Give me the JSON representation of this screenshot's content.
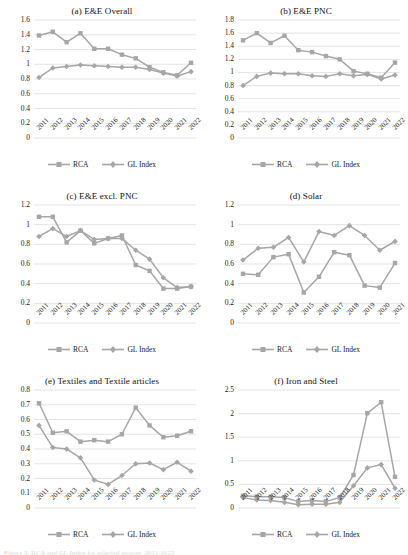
{
  "figure": {
    "caption": "Figure 3. RCA and GL Index for selected sectors, 2011-2022",
    "series_colors": {
      "rca": "#a6a6a6",
      "gl": "#a6a6a6",
      "grid": "#d9d9d9",
      "text": "#222222"
    },
    "legend": [
      {
        "name": "RCA",
        "label": "RCA",
        "marker": "square-marker"
      },
      {
        "name": "GL Index",
        "label": "GL Index",
        "marker": "diamond-marker"
      }
    ]
  },
  "chart_data": [
    {
      "type": "line",
      "panel": "a",
      "title": "(a) E&E Overall",
      "xlabel": "",
      "ylabel": "",
      "grid": true,
      "legend_position": "bottom",
      "ylim": [
        0,
        1.6
      ],
      "yticks": [
        0,
        0.2,
        0.4,
        0.6,
        0.8,
        1,
        1.2,
        1.4,
        1.6
      ],
      "ytick_labels": [
        "0",
        "0.2",
        "0.4",
        "0.6",
        "0.8",
        "1",
        "1.2",
        "1.4",
        "1.6"
      ],
      "categories": [
        "2011",
        "2012",
        "2013",
        "2014",
        "2015",
        "2016",
        "2017",
        "2018",
        "2019",
        "2020",
        "2021",
        "2022"
      ],
      "series": [
        {
          "name": "RCA",
          "values": [
            1.39,
            1.44,
            1.3,
            1.42,
            1.21,
            1.21,
            1.13,
            1.08,
            0.96,
            0.89,
            0.85,
            1.02
          ]
        },
        {
          "name": "GL Index",
          "values": [
            0.82,
            0.95,
            0.97,
            0.99,
            0.98,
            0.97,
            0.96,
            0.96,
            0.93,
            0.88,
            0.84,
            0.9
          ]
        }
      ]
    },
    {
      "type": "line",
      "panel": "b",
      "title": "(b) E&E PNC",
      "xlabel": "",
      "ylabel": "",
      "grid": true,
      "legend_position": "bottom",
      "ylim": [
        0,
        1.8
      ],
      "yticks": [
        0,
        0.2,
        0.4,
        0.6,
        0.8,
        1,
        1.2,
        1.4,
        1.6,
        1.8
      ],
      "ytick_labels": [
        "0",
        "0.2",
        "0.4",
        "0.6",
        "0.8",
        "1",
        "1.2",
        "1.4",
        "1.6",
        "1.8"
      ],
      "categories": [
        "2011",
        "2012",
        "2013",
        "2014",
        "2015",
        "2016",
        "2017",
        "2018",
        "2019",
        "2020",
        "2021",
        "2022"
      ],
      "series": [
        {
          "name": "RCA",
          "values": [
            1.49,
            1.6,
            1.45,
            1.56,
            1.34,
            1.31,
            1.25,
            1.2,
            1.02,
            0.98,
            0.92,
            1.15
          ]
        },
        {
          "name": "GL Index",
          "values": [
            0.8,
            0.94,
            0.99,
            0.98,
            0.98,
            0.95,
            0.94,
            0.98,
            0.95,
            0.97,
            0.9,
            0.96
          ]
        }
      ]
    },
    {
      "type": "line",
      "panel": "c",
      "title": "(c) E&E excl. PNC",
      "xlabel": "",
      "ylabel": "",
      "grid": true,
      "legend_position": "bottom",
      "ylim": [
        0,
        1.2
      ],
      "yticks": [
        0,
        0.2,
        0.4,
        0.6,
        0.8,
        1,
        1.2
      ],
      "ytick_labels": [
        "0",
        "0.2",
        "0.4",
        "0.6",
        "0.8",
        "1",
        "1.2"
      ],
      "categories": [
        "2011",
        "2012",
        "2013",
        "2014",
        "2015",
        "2016",
        "2017",
        "2018",
        "2019",
        "2020",
        "2021",
        "2022"
      ],
      "series": [
        {
          "name": "RCA",
          "values": [
            1.08,
            1.08,
            0.82,
            0.94,
            0.81,
            0.86,
            0.89,
            0.59,
            0.53,
            0.35,
            0.35,
            0.37
          ]
        },
        {
          "name": "GL Index",
          "values": [
            0.88,
            0.96,
            0.88,
            0.94,
            0.85,
            0.86,
            0.86,
            0.74,
            0.65,
            0.46,
            0.36,
            0.37
          ]
        }
      ]
    },
    {
      "type": "line",
      "panel": "d",
      "title": "(d) Solar",
      "xlabel": "",
      "ylabel": "",
      "grid": true,
      "legend_position": "bottom",
      "ylim": [
        0,
        1.2
      ],
      "yticks": [
        0,
        0.2,
        0.4,
        0.6,
        0.8,
        1,
        1.2
      ],
      "ytick_labels": [
        "0",
        "0.2",
        "0.4",
        "0.6",
        "0.8",
        "1",
        "1.2"
      ],
      "categories": [
        "2011",
        "2012",
        "2013",
        "2014",
        "2015",
        "2016",
        "2017",
        "2018",
        "2019",
        "2020",
        "2021"
      ],
      "series": [
        {
          "name": "RCA",
          "values": [
            0.5,
            0.49,
            0.67,
            0.7,
            0.31,
            0.47,
            0.72,
            0.69,
            0.38,
            0.36,
            0.61
          ]
        },
        {
          "name": "GL Index",
          "values": [
            0.64,
            0.76,
            0.77,
            0.87,
            0.62,
            0.93,
            0.89,
            0.99,
            0.89,
            0.74,
            0.83
          ]
        }
      ]
    },
    {
      "type": "line",
      "panel": "e",
      "title": "(e) Textiles and Textile articles",
      "xlabel": "",
      "ylabel": "",
      "grid": true,
      "legend_position": "bottom",
      "ylim": [
        0,
        0.8
      ],
      "yticks": [
        0,
        0.1,
        0.2,
        0.3,
        0.4,
        0.5,
        0.6,
        0.7,
        0.8
      ],
      "ytick_labels": [
        "0",
        "0.1",
        "0.2",
        "0.3",
        "0.4",
        "0.5",
        "0.6",
        "0.7",
        "0.8"
      ],
      "categories": [
        "2011",
        "2012",
        "2013",
        "2014",
        "2015",
        "2016",
        "2017",
        "2018",
        "2019",
        "2020",
        "2021",
        "2022"
      ],
      "series": [
        {
          "name": "RCA",
          "values": [
            0.71,
            0.51,
            0.52,
            0.45,
            0.46,
            0.45,
            0.5,
            0.68,
            0.56,
            0.48,
            0.49,
            0.52
          ]
        },
        {
          "name": "GL Index",
          "values": [
            0.56,
            0.41,
            0.4,
            0.34,
            0.19,
            0.16,
            0.22,
            0.3,
            0.305,
            0.26,
            0.31,
            0.25
          ]
        }
      ]
    },
    {
      "type": "line",
      "panel": "f",
      "title": "(f) Iron and Steel",
      "xlabel": "",
      "ylabel": "",
      "grid": true,
      "legend_position": "bottom",
      "ylim": [
        0,
        2.5
      ],
      "yticks": [
        0,
        0.5,
        1,
        1.5,
        2,
        2.5
      ],
      "ytick_labels": [
        "0",
        "0.5",
        "1",
        "1.5",
        "2",
        "2.5"
      ],
      "categories": [
        "2011",
        "2012",
        "2013",
        "2014",
        "2015",
        "2016",
        "2017",
        "2018",
        "2019",
        "2020",
        "2021",
        "2022"
      ],
      "series": [
        {
          "name": "RCA",
          "values": [
            0.26,
            0.24,
            0.24,
            0.22,
            0.14,
            0.16,
            0.14,
            0.22,
            0.7,
            2.01,
            2.24,
            0.66
          ]
        },
        {
          "name": "GL Index",
          "values": [
            0.22,
            0.17,
            0.16,
            0.12,
            0.07,
            0.08,
            0.08,
            0.12,
            0.47,
            0.85,
            0.92,
            0.42
          ]
        }
      ]
    }
  ]
}
